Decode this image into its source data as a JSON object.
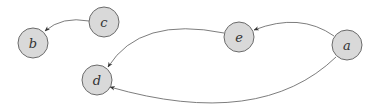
{
  "diagram": {
    "type": "directed-graph",
    "colors": {
      "node_fill": "#d9d9d9",
      "node_stroke": "#6b6b6b",
      "edge": "#6e6e6e",
      "label": "#333333",
      "background": "#ffffff"
    },
    "nodes": [
      {
        "id": "a",
        "label": "a",
        "cx": 347,
        "cy": 45
      },
      {
        "id": "b",
        "label": "b",
        "cx": 33,
        "cy": 43
      },
      {
        "id": "c",
        "label": "c",
        "cx": 104,
        "cy": 22
      },
      {
        "id": "d",
        "label": "d",
        "cx": 97,
        "cy": 80
      },
      {
        "id": "e",
        "label": "e",
        "cx": 239,
        "cy": 37
      }
    ],
    "edges": [
      {
        "from": "c",
        "to": "b"
      },
      {
        "from": "a",
        "to": "e"
      },
      {
        "from": "e",
        "to": "d"
      },
      {
        "from": "a",
        "to": "d"
      }
    ]
  }
}
